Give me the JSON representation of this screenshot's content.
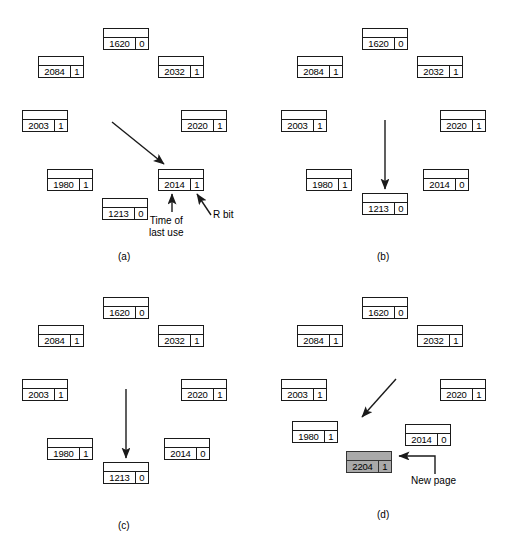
{
  "figure": {
    "panel_label_a": "(a)",
    "panel_label_b": "(b)",
    "panel_label_c": "(c)",
    "panel_label_d": "(d)",
    "annotations": {
      "time_of_last_use_line1": "Time of",
      "time_of_last_use_line2": "last use",
      "r_bit": "R bit",
      "new_page": "New page"
    },
    "colors": {
      "stroke": "#1a1a1a",
      "background": "#ffffff",
      "shaded_fill": "#a9a9a9",
      "shaded_stroke": "#333333"
    }
  },
  "panels": {
    "a": {
      "label": "(a)",
      "frames": [
        {
          "time": "1620",
          "r": "0"
        },
        {
          "time": "2084",
          "r": "1"
        },
        {
          "time": "2032",
          "r": "1"
        },
        {
          "time": "2003",
          "r": "1"
        },
        {
          "time": "2020",
          "r": "1"
        },
        {
          "time": "1980",
          "r": "1"
        },
        {
          "time": "2014",
          "r": "1"
        },
        {
          "time": "1213",
          "r": "0"
        }
      ],
      "pointer": "diagonal-down-right-to-2014"
    },
    "b": {
      "label": "(b)",
      "frames": [
        {
          "time": "1620",
          "r": "0"
        },
        {
          "time": "2084",
          "r": "1"
        },
        {
          "time": "2032",
          "r": "1"
        },
        {
          "time": "2003",
          "r": "1"
        },
        {
          "time": "2020",
          "r": "1"
        },
        {
          "time": "1980",
          "r": "1"
        },
        {
          "time": "2014",
          "r": "0"
        },
        {
          "time": "1213",
          "r": "0"
        }
      ],
      "pointer": "vertical-down-to-1213"
    },
    "c": {
      "label": "(c)",
      "frames": [
        {
          "time": "1620",
          "r": "0"
        },
        {
          "time": "2084",
          "r": "1"
        },
        {
          "time": "2032",
          "r": "1"
        },
        {
          "time": "2003",
          "r": "1"
        },
        {
          "time": "2020",
          "r": "1"
        },
        {
          "time": "1980",
          "r": "1"
        },
        {
          "time": "2014",
          "r": "0"
        },
        {
          "time": "1213",
          "r": "0"
        }
      ],
      "pointer": "vertical-down-to-1213"
    },
    "d": {
      "label": "(d)",
      "frames": [
        {
          "time": "1620",
          "r": "0"
        },
        {
          "time": "2084",
          "r": "1"
        },
        {
          "time": "2032",
          "r": "1"
        },
        {
          "time": "2003",
          "r": "1"
        },
        {
          "time": "2020",
          "r": "1"
        },
        {
          "time": "1980",
          "r": "1"
        },
        {
          "time": "2014",
          "r": "0"
        },
        {
          "time": "2204",
          "r": "1"
        }
      ],
      "pointer": "diagonal-down-left-to-1980",
      "new_page_frame": {
        "time": "2204",
        "r": "1"
      }
    }
  }
}
